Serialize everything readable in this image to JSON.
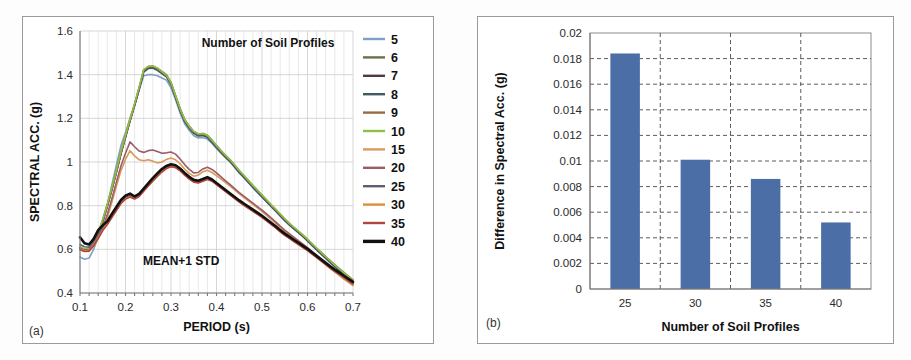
{
  "figure": {
    "background": "#fdfdfd",
    "panel_border": "#9a9a9a"
  },
  "panel_a": {
    "tag": "(a)",
    "legend_title": "Number of Soil Profiles",
    "annotation": "MEAN+1 STD",
    "x_axis_title": "PERIOD (s)",
    "y_axis_title": "SPECTRAL ACC. (g)",
    "x_ticks": [
      "0.1",
      "0.2",
      "0.3",
      "0.4",
      "0.5",
      "0.6",
      "0.7"
    ],
    "y_ticks": [
      "0.4",
      "0.6",
      "0.8",
      "1",
      "1.2",
      "1.4",
      "1.6"
    ]
  },
  "panel_b": {
    "tag": "(b)",
    "x_axis_title": "Number of Soil Profiles",
    "y_axis_title": "Difference in Spectral Acc. (g)",
    "x_ticks": [
      "25",
      "30",
      "35",
      "40"
    ],
    "y_ticks": [
      "0",
      "0.002",
      "0.004",
      "0.006",
      "0.008",
      "0.01",
      "0.012",
      "0.014",
      "0.016",
      "0.018",
      "0.02"
    ],
    "bar_color": "#4a6ea5"
  },
  "chart_data": [
    {
      "id": "spectral-acceleration-curves",
      "type": "line",
      "title": "",
      "legend_title": "Number of Soil Profiles",
      "legend_position": "right",
      "annotation": "MEAN+1 STD",
      "grid": true,
      "xlabel": "PERIOD (s)",
      "ylabel": "SPECTRAL ACC. (g)",
      "xlim": [
        0.1,
        0.7
      ],
      "ylim": [
        0.4,
        1.6
      ],
      "x": [
        0.1,
        0.11,
        0.12,
        0.13,
        0.14,
        0.15,
        0.16,
        0.17,
        0.18,
        0.19,
        0.2,
        0.21,
        0.22,
        0.23,
        0.24,
        0.25,
        0.26,
        0.27,
        0.28,
        0.29,
        0.3,
        0.31,
        0.32,
        0.33,
        0.34,
        0.35,
        0.36,
        0.37,
        0.38,
        0.39,
        0.4,
        0.41,
        0.42,
        0.43,
        0.44,
        0.45,
        0.46,
        0.47,
        0.48,
        0.49,
        0.5,
        0.51,
        0.52,
        0.53,
        0.54,
        0.55,
        0.56,
        0.57,
        0.58,
        0.59,
        0.6,
        0.61,
        0.62,
        0.63,
        0.64,
        0.65,
        0.66,
        0.67,
        0.68,
        0.69,
        0.7
      ],
      "series": [
        {
          "name": "5",
          "color": "#7f9fc4",
          "width": 1.6,
          "values": [
            0.565,
            0.555,
            0.56,
            0.6,
            0.655,
            0.72,
            0.8,
            0.895,
            0.985,
            1.075,
            1.135,
            1.2,
            1.26,
            1.33,
            1.395,
            1.4,
            1.4,
            1.395,
            1.385,
            1.375,
            1.34,
            1.285,
            1.225,
            1.175,
            1.145,
            1.12,
            1.11,
            1.112,
            1.105,
            1.085,
            1.062,
            1.04,
            1.02,
            1.0,
            0.975,
            0.95,
            0.928,
            0.905,
            0.882,
            0.86,
            0.84,
            0.818,
            0.796,
            0.775,
            0.752,
            0.73,
            0.712,
            0.695,
            0.678,
            0.66,
            0.64,
            0.618,
            0.598,
            0.578,
            0.558,
            0.538,
            0.52,
            0.502,
            0.485,
            0.468,
            0.452
          ]
        },
        {
          "name": "6",
          "color": "#6d7046",
          "width": 1.6,
          "values": [
            0.61,
            0.6,
            0.6,
            0.63,
            0.675,
            0.735,
            0.805,
            0.88,
            0.96,
            1.045,
            1.12,
            1.195,
            1.265,
            1.34,
            1.42,
            1.437,
            1.44,
            1.43,
            1.415,
            1.4,
            1.365,
            1.305,
            1.245,
            1.195,
            1.165,
            1.14,
            1.128,
            1.13,
            1.122,
            1.1,
            1.075,
            1.052,
            1.03,
            1.01,
            0.985,
            0.96,
            0.938,
            0.915,
            0.892,
            0.87,
            0.848,
            0.826,
            0.804,
            0.782,
            0.76,
            0.738,
            0.718,
            0.7,
            0.682,
            0.664,
            0.645,
            0.624,
            0.604,
            0.584,
            0.564,
            0.545,
            0.526,
            0.508,
            0.49,
            0.472,
            0.455
          ]
        },
        {
          "name": "7",
          "color": "#503b44",
          "width": 1.6,
          "values": [
            0.608,
            0.598,
            0.598,
            0.628,
            0.672,
            0.73,
            0.8,
            0.875,
            0.955,
            1.04,
            1.115,
            1.19,
            1.26,
            1.335,
            1.415,
            1.43,
            1.432,
            1.422,
            1.408,
            1.392,
            1.358,
            1.298,
            1.238,
            1.188,
            1.158,
            1.134,
            1.122,
            1.124,
            1.116,
            1.094,
            1.07,
            1.046,
            1.024,
            1.004,
            0.98,
            0.955,
            0.933,
            0.91,
            0.887,
            0.865,
            0.843,
            0.821,
            0.799,
            0.778,
            0.756,
            0.734,
            0.714,
            0.696,
            0.678,
            0.66,
            0.641,
            0.62,
            0.6,
            0.58,
            0.561,
            0.542,
            0.523,
            0.505,
            0.487,
            0.47,
            0.453
          ]
        },
        {
          "name": "8",
          "color": "#3f5a61",
          "width": 1.6,
          "values": [
            0.605,
            0.596,
            0.596,
            0.626,
            0.67,
            0.728,
            0.798,
            0.873,
            0.953,
            1.038,
            1.112,
            1.188,
            1.258,
            1.332,
            1.412,
            1.428,
            1.43,
            1.42,
            1.405,
            1.39,
            1.355,
            1.295,
            1.235,
            1.185,
            1.155,
            1.131,
            1.119,
            1.121,
            1.113,
            1.091,
            1.067,
            1.043,
            1.021,
            1.001,
            0.977,
            0.952,
            0.93,
            0.907,
            0.884,
            0.862,
            0.84,
            0.818,
            0.797,
            0.776,
            0.754,
            0.732,
            0.712,
            0.694,
            0.676,
            0.658,
            0.639,
            0.618,
            0.598,
            0.579,
            0.56,
            0.541,
            0.522,
            0.504,
            0.486,
            0.469,
            0.452
          ]
        },
        {
          "name": "9",
          "color": "#9a6b3f",
          "width": 1.6,
          "values": [
            0.6,
            0.592,
            0.592,
            0.622,
            0.668,
            0.726,
            0.796,
            0.872,
            0.952,
            1.038,
            1.114,
            1.192,
            1.262,
            1.338,
            1.42,
            1.436,
            1.438,
            1.428,
            1.412,
            1.396,
            1.362,
            1.302,
            1.242,
            1.192,
            1.162,
            1.138,
            1.126,
            1.128,
            1.12,
            1.098,
            1.074,
            1.05,
            1.028,
            1.008,
            0.984,
            0.959,
            0.937,
            0.914,
            0.891,
            0.869,
            0.847,
            0.825,
            0.803,
            0.782,
            0.76,
            0.738,
            0.718,
            0.7,
            0.682,
            0.664,
            0.645,
            0.624,
            0.605,
            0.586,
            0.567,
            0.548,
            0.53,
            0.512,
            0.494,
            0.477,
            0.46
          ]
        },
        {
          "name": "10",
          "color": "#8dc04a",
          "width": 1.6,
          "values": [
            0.612,
            0.602,
            0.602,
            0.632,
            0.678,
            0.738,
            0.808,
            0.884,
            0.964,
            1.05,
            1.124,
            1.198,
            1.268,
            1.344,
            1.424,
            1.438,
            1.44,
            1.43,
            1.414,
            1.398,
            1.364,
            1.304,
            1.244,
            1.194,
            1.164,
            1.14,
            1.128,
            1.13,
            1.122,
            1.1,
            1.076,
            1.052,
            1.03,
            1.01,
            0.986,
            0.961,
            0.939,
            0.916,
            0.893,
            0.871,
            0.849,
            0.827,
            0.805,
            0.784,
            0.762,
            0.74,
            0.72,
            0.702,
            0.684,
            0.666,
            0.647,
            0.626,
            0.606,
            0.586,
            0.566,
            0.547,
            0.528,
            0.51,
            0.492,
            0.474,
            0.457
          ]
        },
        {
          "name": "15",
          "color": "#d99a5a",
          "width": 1.6,
          "values": [
            0.6,
            0.592,
            0.594,
            0.615,
            0.648,
            0.69,
            0.745,
            0.815,
            0.89,
            0.96,
            1.012,
            1.052,
            1.028,
            1.01,
            1.006,
            1.01,
            1.004,
            0.996,
            1.0,
            1.012,
            1.018,
            1.01,
            0.992,
            0.968,
            0.948,
            0.935,
            0.94,
            0.955,
            0.962,
            0.952,
            0.938,
            0.922,
            0.906,
            0.89,
            0.872,
            0.854,
            0.838,
            0.822,
            0.806,
            0.79,
            0.774,
            0.756,
            0.738,
            0.72,
            0.7,
            0.682,
            0.666,
            0.65,
            0.634,
            0.618,
            0.602,
            0.584,
            0.566,
            0.548,
            0.53,
            0.512,
            0.496,
            0.48,
            0.464,
            0.449,
            0.434
          ]
        },
        {
          "name": "20",
          "color": "#9b5c68",
          "width": 1.6,
          "values": [
            0.604,
            0.596,
            0.598,
            0.62,
            0.655,
            0.7,
            0.76,
            0.832,
            0.908,
            0.982,
            1.04,
            1.092,
            1.07,
            1.05,
            1.044,
            1.052,
            1.055,
            1.048,
            1.04,
            1.042,
            1.046,
            1.036,
            1.014,
            0.988,
            0.966,
            0.95,
            0.952,
            0.968,
            0.976,
            0.966,
            0.95,
            0.932,
            0.914,
            0.896,
            0.878,
            0.86,
            0.844,
            0.828,
            0.812,
            0.796,
            0.78,
            0.762,
            0.744,
            0.726,
            0.706,
            0.688,
            0.672,
            0.656,
            0.64,
            0.624,
            0.608,
            0.59,
            0.572,
            0.554,
            0.536,
            0.518,
            0.502,
            0.486,
            0.47,
            0.455,
            0.44
          ]
        },
        {
          "name": "25",
          "color": "#5f5f72",
          "width": 1.6,
          "values": [
            0.622,
            0.612,
            0.61,
            0.635,
            0.672,
            0.705,
            0.73,
            0.76,
            0.79,
            0.82,
            0.838,
            0.846,
            0.836,
            0.848,
            0.872,
            0.896,
            0.918,
            0.94,
            0.96,
            0.975,
            0.982,
            0.978,
            0.964,
            0.944,
            0.926,
            0.912,
            0.908,
            0.916,
            0.924,
            0.916,
            0.9,
            0.884,
            0.868,
            0.852,
            0.836,
            0.82,
            0.806,
            0.792,
            0.778,
            0.764,
            0.75,
            0.734,
            0.718,
            0.702,
            0.684,
            0.668,
            0.654,
            0.64,
            0.626,
            0.612,
            0.598,
            0.582,
            0.566,
            0.55,
            0.534,
            0.518,
            0.503,
            0.489,
            0.475,
            0.461,
            0.447
          ]
        },
        {
          "name": "30",
          "color": "#e08c3c",
          "width": 1.6,
          "values": [
            0.6,
            0.592,
            0.594,
            0.618,
            0.652,
            0.688,
            0.716,
            0.748,
            0.78,
            0.812,
            0.832,
            0.842,
            0.832,
            0.844,
            0.868,
            0.892,
            0.914,
            0.936,
            0.956,
            0.972,
            0.98,
            0.976,
            0.962,
            0.942,
            0.924,
            0.91,
            0.906,
            0.914,
            0.922,
            0.914,
            0.898,
            0.882,
            0.866,
            0.85,
            0.834,
            0.818,
            0.804,
            0.79,
            0.776,
            0.762,
            0.748,
            0.732,
            0.716,
            0.7,
            0.682,
            0.666,
            0.652,
            0.638,
            0.624,
            0.61,
            0.596,
            0.58,
            0.564,
            0.548,
            0.532,
            0.516,
            0.501,
            0.487,
            0.473,
            0.459,
            0.445
          ]
        },
        {
          "name": "35",
          "color": "#b0463c",
          "width": 1.6,
          "values": [
            0.598,
            0.59,
            0.592,
            0.616,
            0.65,
            0.686,
            0.714,
            0.746,
            0.778,
            0.81,
            0.83,
            0.84,
            0.83,
            0.842,
            0.866,
            0.89,
            0.912,
            0.934,
            0.954,
            0.97,
            0.978,
            0.974,
            0.96,
            0.94,
            0.922,
            0.908,
            0.904,
            0.912,
            0.92,
            0.912,
            0.896,
            0.88,
            0.864,
            0.848,
            0.832,
            0.816,
            0.802,
            0.788,
            0.774,
            0.76,
            0.746,
            0.73,
            0.714,
            0.698,
            0.68,
            0.664,
            0.65,
            0.636,
            0.622,
            0.608,
            0.594,
            0.578,
            0.562,
            0.546,
            0.53,
            0.514,
            0.499,
            0.485,
            0.471,
            0.457,
            0.443
          ]
        },
        {
          "name": "40",
          "color": "#111111",
          "width": 2.6,
          "values": [
            0.655,
            0.628,
            0.622,
            0.648,
            0.688,
            0.71,
            0.728,
            0.762,
            0.794,
            0.826,
            0.846,
            0.855,
            0.842,
            0.854,
            0.878,
            0.902,
            0.926,
            0.948,
            0.968,
            0.982,
            0.99,
            0.985,
            0.97,
            0.95,
            0.932,
            0.918,
            0.914,
            0.922,
            0.93,
            0.92,
            0.904,
            0.888,
            0.872,
            0.856,
            0.84,
            0.824,
            0.81,
            0.796,
            0.782,
            0.768,
            0.754,
            0.738,
            0.722,
            0.706,
            0.688,
            0.672,
            0.658,
            0.644,
            0.63,
            0.616,
            0.602,
            0.586,
            0.57,
            0.554,
            0.538,
            0.522,
            0.507,
            0.493,
            0.479,
            0.465,
            0.451
          ]
        }
      ]
    },
    {
      "id": "difference-in-spectral-acceleration",
      "type": "bar",
      "title": "",
      "grid": true,
      "xlabel": "Number of Soil Profiles",
      "ylabel": "Difference in Spectral Acc. (g)",
      "categories": [
        "25",
        "30",
        "35",
        "40"
      ],
      "values": [
        0.0184,
        0.0101,
        0.0086,
        0.0052
      ],
      "ylim": [
        0,
        0.02
      ],
      "bar_color": "#4a6ea5"
    }
  ]
}
